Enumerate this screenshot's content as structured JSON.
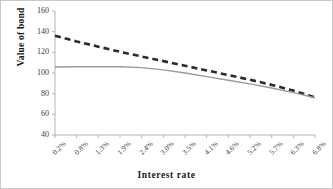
{
  "chart_data": {
    "type": "line",
    "title": "",
    "xlabel": "Interest  rate",
    "ylabel": "Value of bond",
    "categories": [
      "0.2%",
      "0.8%",
      "1.3%",
      "1.9%",
      "2.4%",
      "3.0%",
      "3.5%",
      "4.1%",
      "4.6%",
      "5.2%",
      "5.7%",
      "6.3%",
      "6.8%"
    ],
    "x_tick_rotation": -45,
    "ylim": [
      40,
      160
    ],
    "y_ticks": [
      40,
      60,
      80,
      100,
      120,
      140,
      160
    ],
    "grid": false,
    "legend": "none",
    "series": [
      {
        "name": "premium-bond",
        "style": "dashed",
        "color": "#2b2b2b",
        "values": [
          136.0,
          130.5,
          125.5,
          120.5,
          116.0,
          111.5,
          107.0,
          102.5,
          98.0,
          93.5,
          88.5,
          83.0,
          76.5
        ]
      },
      {
        "name": "discount-bond",
        "style": "solid",
        "color": "#9a9a9a",
        "values": [
          105.8,
          106.0,
          106.1,
          106.0,
          105.2,
          103.0,
          100.0,
          96.5,
          93.0,
          89.5,
          85.5,
          81.0,
          76.0
        ]
      }
    ]
  },
  "axes": {
    "y_tick_labels": [
      "160",
      "140",
      "120",
      "100",
      "80",
      "60",
      "40"
    ],
    "x_tick_labels": [
      "0.2%",
      "0.8%",
      "1.3%",
      "1.9%",
      "2.4%",
      "3.0%",
      "3.5%",
      "4.1%",
      "4.6%",
      "5.2%",
      "5.7%",
      "6.3%",
      "6.8%"
    ],
    "y_axis_title": "Value of bond",
    "x_axis_title": "Interest  rate"
  },
  "colors": {
    "axis": "#b5b5b5",
    "series_dashed": "#2b2b2b",
    "series_solid": "#9a9a9a",
    "text": "#3a3a3a",
    "frame": "#c9c9c9",
    "background": "#ffffff"
  }
}
